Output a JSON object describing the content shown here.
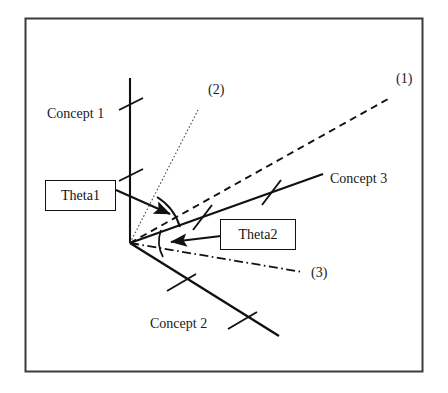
{
  "figure": {
    "frame": {
      "stroke": "#3b3b3b",
      "x": 25,
      "y": 18,
      "width": 398,
      "height": 354
    },
    "origin": {
      "x": 130,
      "y": 243
    },
    "ink_color": "#111111",
    "background": "#ffffff"
  },
  "axes": [
    {
      "id": "concept-1",
      "label": "Concept 1",
      "style": "solid",
      "from": [
        130,
        243
      ],
      "to": [
        130,
        78
      ],
      "ticks": 2
    },
    {
      "id": "concept-2",
      "label": "Concept 2",
      "style": "solid",
      "from": [
        130,
        243
      ],
      "to": [
        278,
        336
      ],
      "ticks": 2
    },
    {
      "id": "concept-3",
      "label": "Concept 3",
      "style": "solid",
      "from": [
        130,
        243
      ],
      "to": [
        322,
        174
      ],
      "ticks": 2
    }
  ],
  "vectors": [
    {
      "id": "line-1",
      "label": "(1)",
      "style": "dashed",
      "from": [
        130,
        243
      ],
      "to": [
        387,
        99
      ]
    },
    {
      "id": "line-2",
      "label": "(2)",
      "style": "dotted",
      "from": [
        130,
        243
      ],
      "to": [
        198,
        110
      ]
    },
    {
      "id": "line-3",
      "label": "(3)",
      "style": "dash-dot",
      "from": [
        130,
        243
      ],
      "to": [
        301,
        272
      ]
    }
  ],
  "angles": [
    {
      "id": "theta1",
      "label": "Theta1",
      "arc_radius": 53,
      "between": [
        "line-2",
        "line-1"
      ]
    },
    {
      "id": "theta2",
      "label": "Theta2",
      "arc_radius": 33,
      "between": [
        "concept-3",
        "line-3"
      ]
    }
  ],
  "callouts": [
    {
      "id": "theta1-callout",
      "label": "Theta1",
      "box": {
        "x": 45,
        "y": 180,
        "width": 71,
        "height": 31
      },
      "leader_from": [
        116,
        191
      ],
      "leader_to": [
        174,
        216
      ]
    },
    {
      "id": "theta2-callout",
      "label": "Theta2",
      "box": {
        "x": 220,
        "y": 219,
        "width": 76,
        "height": 31
      },
      "leader_from": [
        220,
        236
      ],
      "leader_to": [
        168,
        243
      ]
    }
  ]
}
